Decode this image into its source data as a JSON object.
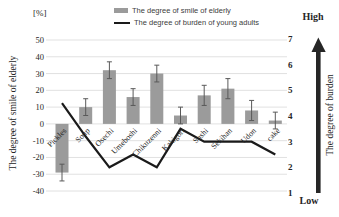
{
  "chart": {
    "percent_unit": "[%]",
    "legend": {
      "smile_label": "The degree of smile of elderly",
      "burden_label": "The degree of burden of young adults"
    },
    "left_axis_title": "The degree of smile of elderly",
    "right_axis_title": "The degree of burden",
    "right_axis_high": "High",
    "right_axis_low": "Low"
  },
  "chart_data": {
    "type": "bar",
    "categories": [
      "Pickles",
      "Soup",
      "Osechi",
      "Umeboshi",
      "Chikuzenni",
      "Kakigori",
      "Sushi",
      "Sekihan",
      "Udon",
      "cake"
    ],
    "series": [
      {
        "name": "The degree of smile of elderly",
        "type": "bar",
        "axis": "left",
        "unit": "%",
        "values": [
          -29,
          10,
          32,
          16,
          30,
          5,
          17,
          21,
          8,
          2
        ],
        "error_bars": [
          5,
          5,
          5,
          5,
          5,
          5,
          6,
          6,
          6,
          5
        ]
      },
      {
        "name": "The degree of burden of young adults",
        "type": "line",
        "axis": "right",
        "values": [
          4.5,
          3.2,
          2,
          2.5,
          2,
          3.5,
          3,
          3,
          3,
          2.5
        ]
      }
    ],
    "left_axis": {
      "label": "The degree of smile of elderly",
      "unit": "[%]",
      "min": -40,
      "max": 50,
      "tick_step": 10
    },
    "right_axis": {
      "label": "The degree of burden",
      "min": 1,
      "max": 7,
      "tick_step": 1,
      "high_label": "High",
      "low_label": "Low"
    },
    "grid": true,
    "legend_position": "top"
  },
  "colors": {
    "bar": "#9b9b9b",
    "line": "#1a1a1a",
    "grid": "#d9d9d9",
    "error_bar": "#595959",
    "arrow": "#262626",
    "text": "#262626",
    "legend_text": "#404040",
    "background": "#ffffff"
  }
}
